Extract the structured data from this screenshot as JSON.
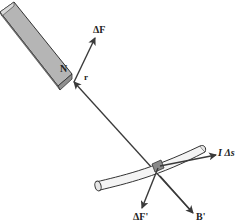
{
  "figure": {
    "type": "physics-diagram"
  },
  "labels": {
    "delta_F": "ΔF",
    "north_pole": "N",
    "r": "r",
    "I_delta_s": "I Δs",
    "delta_F_prime": "ΔF'",
    "B_prime": "B'"
  },
  "colors": {
    "magnet_fill": "#b5b5b5",
    "magnet_top": "#d9d9d9",
    "magnet_edge": "#333333",
    "arrow": "#3a3a3a",
    "wire_fill": "#f4f4f4",
    "band": "#8a8a8a",
    "background": "#ffffff"
  }
}
